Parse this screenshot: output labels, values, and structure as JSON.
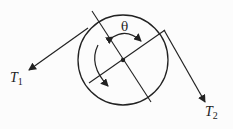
{
  "diagram": {
    "labels": {
      "t1": {
        "main": "T",
        "sub": "1"
      },
      "t2": {
        "main": "T",
        "sub": "2"
      },
      "theta": "θ"
    },
    "colors": {
      "stroke": "#222222"
    }
  }
}
